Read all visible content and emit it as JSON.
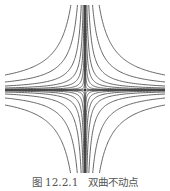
{
  "figure": {
    "caption": "图 12.2.1　双曲不动点",
    "type": "phase portrait",
    "center": [
      85,
      90
    ],
    "stroke_color": "#555555",
    "axis_color": "#333333",
    "levels": [
      3,
      12,
      35,
      80,
      160,
      320,
      640,
      1200
    ]
  }
}
